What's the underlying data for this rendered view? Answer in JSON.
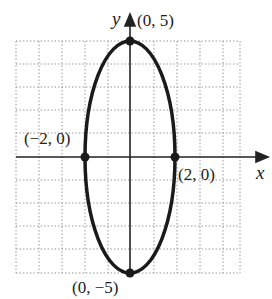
{
  "diagram": {
    "type": "ellipse-graph",
    "equation_shown": false,
    "axes": {
      "x_label": "x",
      "y_label": "y"
    },
    "grid": {
      "x_min": -5,
      "x_max": 5,
      "y_min": -5,
      "y_max": 5,
      "step": 1
    },
    "points": [
      {
        "label": "(0, 5)",
        "x": 0,
        "y": 5
      },
      {
        "label": "(−2, 0)",
        "x": -2,
        "y": 0
      },
      {
        "label": "(2, 0)",
        "x": 2,
        "y": 0
      },
      {
        "label": "(0, −5)",
        "x": 0,
        "y": -5
      }
    ],
    "ellipse": {
      "center": [
        0,
        0
      ],
      "semi_x": 2,
      "semi_y": 5
    }
  }
}
